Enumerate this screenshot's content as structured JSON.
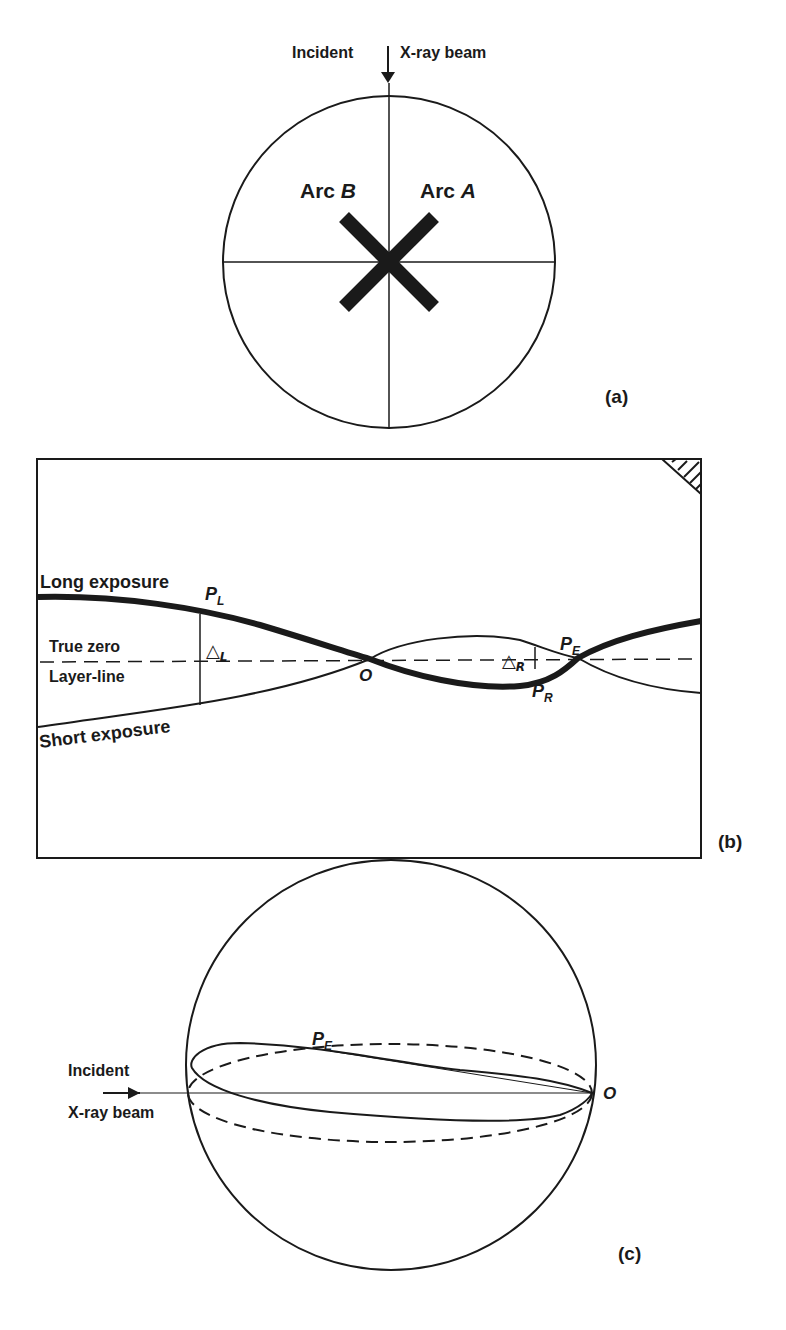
{
  "panel_a": {
    "label": "(a)",
    "incident_label": "Incident",
    "beam_label": "X-ray beam",
    "arc_b_prefix": "Arc ",
    "arc_b_letter": "B",
    "arc_a_prefix": "Arc ",
    "arc_a_letter": "A"
  },
  "panel_b": {
    "label": "(b)",
    "long_exposure": "Long exposure",
    "true_zero": "True zero",
    "layer_line": "Layer-line",
    "short_exposure": "Short exposure",
    "p_l": "P",
    "p_l_sub": "L",
    "delta_l": "△",
    "delta_l_sub": "L",
    "origin": "O",
    "delta_r": "△",
    "delta_r_sub": "R",
    "p_e": "P",
    "p_e_sub": "E",
    "p_r": "P",
    "p_r_sub": "R"
  },
  "panel_c": {
    "label": "(c)",
    "incident_label": "Incident",
    "beam_label": "X-ray beam",
    "p_e": "P",
    "p_e_sub": "E",
    "origin": "O"
  },
  "colors": {
    "ink": "#1a1a1a",
    "background": "#ffffff"
  }
}
